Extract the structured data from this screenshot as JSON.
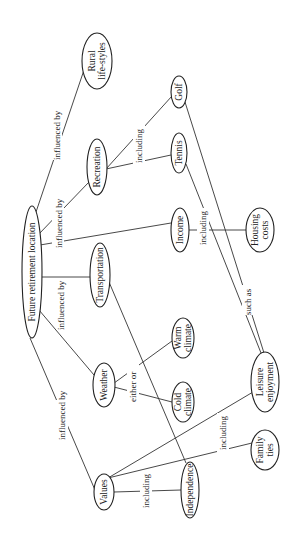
{
  "diagram": {
    "type": "concept-map",
    "orientation": "rotated-90-ccw",
    "nodes": {
      "root": {
        "label": "Future retirement location",
        "cx": 32,
        "cy": 272,
        "rx": 10,
        "ry": 66
      },
      "rural": {
        "line1": "Rural",
        "line2": "life-styles",
        "cx": 97,
        "cy": 61,
        "rx": 15,
        "ry": 28
      },
      "recreation": {
        "label": "Recreation",
        "cx": 97,
        "cy": 167,
        "rx": 10,
        "ry": 28
      },
      "golf": {
        "label": "Golf",
        "cx": 179,
        "cy": 92,
        "rx": 8,
        "ry": 16
      },
      "tennis": {
        "label": "Tennis",
        "cx": 179,
        "cy": 153,
        "rx": 8,
        "ry": 20
      },
      "income": {
        "label": "Income",
        "cx": 180,
        "cy": 230,
        "rx": 9,
        "ry": 22
      },
      "housing": {
        "line1": "Housing",
        "line2": "costs",
        "cx": 260,
        "cy": 230,
        "rx": 14,
        "ry": 22
      },
      "transportation": {
        "label": "Transportation",
        "cx": 100,
        "cy": 275,
        "rx": 10,
        "ry": 32
      },
      "warm": {
        "line1": "Warm",
        "line2": "climate",
        "cx": 183,
        "cy": 338,
        "rx": 11,
        "ry": 20
      },
      "weather": {
        "label": "Weather",
        "cx": 104,
        "cy": 385,
        "rx": 11,
        "ry": 22
      },
      "cold": {
        "line1": "Cold",
        "line2": "climate",
        "cx": 183,
        "cy": 402,
        "rx": 11,
        "ry": 20
      },
      "leisure": {
        "line1": "Leisure",
        "line2": "enjoyment",
        "cx": 265,
        "cy": 382,
        "rx": 14,
        "ry": 30
      },
      "family": {
        "line1": "Family",
        "line2": "ties",
        "cx": 265,
        "cy": 450,
        "rx": 14,
        "ry": 20
      },
      "values": {
        "label": "Values",
        "cx": 104,
        "cy": 492,
        "rx": 10,
        "ry": 18
      },
      "independence": {
        "label": "Independence",
        "cx": 190,
        "cy": 490,
        "rx": 9,
        "ry": 28
      }
    },
    "edge_labels": {
      "rural": "influenced by",
      "recreation": "influenced by",
      "transportation": "influenced by",
      "values": "influenced by",
      "recreation_including": "including",
      "income_including": "including",
      "weather_either_or": "either  or",
      "golf_such_as": "such as",
      "values_including_leisure": "including",
      "values_including_independence": "including"
    }
  }
}
